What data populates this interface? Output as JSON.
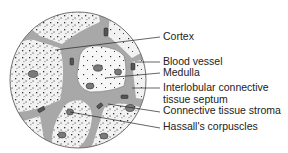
{
  "diagram": {
    "colors": {
      "background": "#ffffff",
      "lobule_fill": "#f2f2f2",
      "septum_fill": "#a8a8a8",
      "outline": "#444444",
      "dots": "#333333",
      "cell_fill": "#7a7a7a",
      "leader_line": "#222222",
      "label_text": "#222222"
    },
    "labels": [
      {
        "id": "cortex",
        "text": "Cortex",
        "y": 31
      },
      {
        "id": "blood-vessel",
        "text": "Blood vessel",
        "y": 56
      },
      {
        "id": "medulla",
        "text": "Medulla",
        "y": 67
      },
      {
        "id": "interlobular-septum-line1",
        "text": "Interlobular connective",
        "y": 82
      },
      {
        "id": "interlobular-septum-line2",
        "text": "tissue septum",
        "y": 94
      },
      {
        "id": "stroma",
        "text": "Connective tissue stroma",
        "y": 105
      },
      {
        "id": "hassalls",
        "text": "Hassall's corpuscles",
        "y": 121
      }
    ]
  }
}
